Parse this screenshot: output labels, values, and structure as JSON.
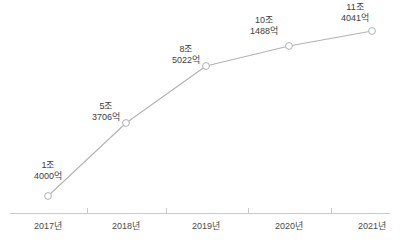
{
  "chart_data": {
    "type": "line",
    "title": "",
    "subtitle": "",
    "xlabel": "",
    "ylabel": "",
    "grid": false,
    "legend": false,
    "categories": [
      "2017년",
      "2018년",
      "2019년",
      "2020년",
      "2021년"
    ],
    "values": [
      14000,
      53706,
      85022,
      101488,
      114041
    ],
    "unit": "억원",
    "value_labels": [
      {
        "top": "1조",
        "bottom": "4000억"
      },
      {
        "top": "5조",
        "bottom": "3706억"
      },
      {
        "top": "8조",
        "bottom": "5022억"
      },
      {
        "top": "10조",
        "bottom": "1488억"
      },
      {
        "top": "11조",
        "bottom": "4041억"
      }
    ],
    "points": [
      {
        "x": 48,
        "y": 196
      },
      {
        "x": 126,
        "y": 123
      },
      {
        "x": 206,
        "y": 66
      },
      {
        "x": 289,
        "y": 46
      },
      {
        "x": 372,
        "y": 31
      }
    ],
    "label_positions": [
      {
        "x": 48,
        "y": 160,
        "align": "center"
      },
      {
        "x": 106,
        "y": 101,
        "align": "center"
      },
      {
        "x": 186,
        "y": 44,
        "align": "center"
      },
      {
        "x": 264,
        "y": 15,
        "align": "center"
      },
      {
        "x": 355,
        "y": 2,
        "align": "center"
      }
    ],
    "tick_label_positions": [
      48,
      126,
      206,
      289,
      372
    ],
    "axis": {
      "x_start": 10,
      "x_end": 390,
      "y": 213,
      "tick_xs": [
        87,
        166,
        248,
        331
      ],
      "tick_height": 5
    },
    "colors": {
      "line": "#b3b3b3",
      "marker_stroke": "#b0b0b0",
      "marker_fill": "#ffffff",
      "axis": "#c9c9c9",
      "text": "#3d3d3d",
      "tick_text": "#4a4a4a",
      "background": "#ffffff"
    },
    "marker": {
      "shape": "circle",
      "radius": 3.4,
      "stroke_width": 1
    },
    "line_width": 1.1
  }
}
